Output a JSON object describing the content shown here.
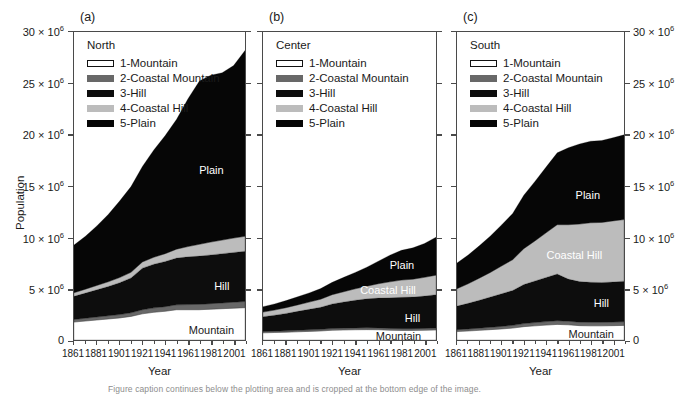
{
  "figure": {
    "ylabel": "Population",
    "xlabel": "Year",
    "caption": "Figure caption continues below the plotting area and is cropped at the bottom edge of the image."
  },
  "axes": {
    "y_ticks": [
      {
        "value": 0,
        "label": "0",
        "exp": ""
      },
      {
        "value": 5000000,
        "label": "5 × 10",
        "exp": "6"
      },
      {
        "value": 10000000,
        "label": "10 × 10",
        "exp": "6"
      },
      {
        "value": 15000000,
        "label": "15 × 10",
        "exp": "6"
      },
      {
        "value": 20000000,
        "label": "20 × 10",
        "exp": "6"
      },
      {
        "value": 25000000,
        "label": "25 × 10",
        "exp": "6"
      },
      {
        "value": 30000000,
        "label": "30 × 10",
        "exp": "6"
      }
    ],
    "x_ticks": [
      "1861",
      "1881",
      "1901",
      "1921",
      "1941",
      "1961",
      "1981",
      "2001"
    ],
    "ylim": [
      0,
      30000000
    ],
    "xlim": [
      1861,
      2011
    ]
  },
  "legend": {
    "entries": [
      {
        "key": "mountain",
        "label": "1-Mountain",
        "color": "#ffffff"
      },
      {
        "key": "cmountain",
        "label": "2-Coastal Mountain",
        "color": "#686868"
      },
      {
        "key": "hill",
        "label": "3-Hill",
        "color": "#0d0d0d"
      },
      {
        "key": "chill",
        "label": "4-Coastal Hill",
        "color": "#bcbcbc"
      },
      {
        "key": "plain",
        "label": "5-Plain",
        "color": "#060606"
      }
    ]
  },
  "panels": [
    {
      "tag": "(a)",
      "region": "North"
    },
    {
      "tag": "(b)",
      "region": "Center"
    },
    {
      "tag": "(c)",
      "region": "South"
    }
  ],
  "area_labels": {
    "a": [
      "Plain",
      "Hill",
      "Mountain"
    ],
    "b": [
      "Plain",
      "Coastal Hill",
      "Hill",
      "Mountain"
    ],
    "c": [
      "Plain",
      "Coastal Hill",
      "Hill",
      "Mountain"
    ]
  },
  "chart_data": {
    "type": "area",
    "title": "",
    "xlabel": "Year",
    "ylabel": "Population",
    "ylim": [
      0,
      30000000
    ],
    "xlim": [
      1861,
      2011
    ],
    "grid": false,
    "legend_position": "upper-left inside each panel",
    "stacked": true,
    "x": [
      1861,
      1871,
      1881,
      1891,
      1901,
      1911,
      1921,
      1931,
      1941,
      1951,
      1961,
      1971,
      1981,
      1991,
      2001,
      2011
    ],
    "panels": [
      {
        "tag": "(a)",
        "region": "North",
        "series": [
          {
            "name": "1-Mountain",
            "color": "#ffffff",
            "values": [
              1750000,
              1850000,
              1950000,
              2050000,
              2150000,
              2300000,
              2550000,
              2700000,
              2800000,
              2950000,
              2950000,
              2950000,
              3000000,
              3050000,
              3100000,
              3150000
            ]
          },
          {
            "name": "2-Coastal Mountain",
            "color": "#686868",
            "values": [
              250000,
              270000,
              290000,
              310000,
              330000,
              350000,
              400000,
              430000,
              450000,
              480000,
              500000,
              520000,
              540000,
              560000,
              580000,
              600000
            ]
          },
          {
            "name": "3-Hill",
            "color": "#0d0d0d",
            "values": [
              2250000,
              2450000,
              2650000,
              2850000,
              3100000,
              3400000,
              4050000,
              4250000,
              4400000,
              4550000,
              4650000,
              4700000,
              4750000,
              4800000,
              4850000,
              4900000
            ]
          },
          {
            "name": "4-Coastal Hill",
            "color": "#bcbcbc",
            "values": [
              350000,
              380000,
              420000,
              460000,
              500000,
              540000,
              600000,
              680000,
              760000,
              870000,
              1000000,
              1150000,
              1250000,
              1320000,
              1400000,
              1450000
            ]
          },
          {
            "name": "5-Plain",
            "color": "#060606",
            "values": [
              4650000,
              5150000,
              5800000,
              6550000,
              7450000,
              8350000,
              9300000,
              10450000,
              11500000,
              12650000,
              14400000,
              15900000,
              16250000,
              16300000,
              16800000,
              18100000
            ]
          }
        ],
        "totals": [
          9250000,
          10100000,
          11110000,
          12230000,
          13530000,
          14940000,
          16900000,
          18510000,
          19910000,
          21500000,
          23500000,
          25220000,
          25790000,
          26030000,
          26730000,
          28200000
        ]
      },
      {
        "tag": "(b)",
        "region": "Center",
        "series": [
          {
            "name": "1-Mountain",
            "color": "#ffffff",
            "values": [
              700000,
              730000,
              760000,
              800000,
              840000,
              880000,
              950000,
              980000,
              1000000,
              1010000,
              1000000,
              950000,
              930000,
              930000,
              950000,
              980000
            ]
          },
          {
            "name": "2-Coastal Mountain",
            "color": "#686868",
            "values": [
              120000,
              125000,
              130000,
              140000,
              150000,
              155000,
              165000,
              170000,
              175000,
              180000,
              180000,
              175000,
              175000,
              175000,
              180000,
              185000
            ]
          },
          {
            "name": "3-Hill",
            "color": "#0d0d0d",
            "values": [
              1450000,
              1560000,
              1700000,
              1850000,
              2000000,
              2150000,
              2400000,
              2550000,
              2700000,
              2820000,
              2900000,
              2980000,
              3050000,
              3080000,
              3150000,
              3250000
            ]
          },
          {
            "name": "4-Coastal Hill",
            "color": "#bcbcbc",
            "values": [
              450000,
              500000,
              560000,
              630000,
              700000,
              790000,
              900000,
              1000000,
              1110000,
              1230000,
              1400000,
              1560000,
              1680000,
              1740000,
              1820000,
              1900000
            ]
          },
          {
            "name": "5-Plain",
            "color": "#060606",
            "values": [
              530000,
              600000,
              690000,
              790000,
              900000,
              1030000,
              1200000,
              1400000,
              1600000,
              1850000,
              2200000,
              2600000,
              2900000,
              3050000,
              3300000,
              3700000
            ]
          }
        ],
        "totals": [
          3250000,
          3515000,
          3840000,
          4210000,
          4590000,
          5005000,
          5615000,
          6100000,
          6585000,
          7090000,
          7680000,
          8265000,
          8735000,
          8975000,
          9400000,
          10015000
        ]
      },
      {
        "tag": "(c)",
        "region": "South",
        "series": [
          {
            "name": "1-Mountain",
            "color": "#ffffff",
            "values": [
              820000,
              880000,
              940000,
              1010000,
              1080000,
              1160000,
              1300000,
              1380000,
              1450000,
              1520000,
              1480000,
              1400000,
              1380000,
              1380000,
              1400000,
              1420000
            ]
          },
          {
            "name": "2-Coastal Mountain",
            "color": "#686868",
            "values": [
              180000,
              195000,
              210000,
              225000,
              245000,
              265000,
              300000,
              320000,
              340000,
              360000,
              350000,
              340000,
              340000,
              340000,
              350000,
              360000
            ]
          },
          {
            "name": "3-Hill",
            "color": "#0d0d0d",
            "values": [
              2300000,
              2500000,
              2720000,
              2950000,
              3180000,
              3400000,
              3800000,
              4050000,
              4300000,
              4550000,
              4100000,
              3950000,
              3900000,
              3880000,
              3900000,
              3950000
            ]
          },
          {
            "name": "4-Coastal Hill",
            "color": "#bcbcbc",
            "values": [
              1700000,
              1900000,
              2150000,
              2400000,
              2700000,
              3000000,
              3500000,
              3900000,
              4350000,
              4800000,
              5300000,
              5600000,
              5800000,
              5850000,
              5950000,
              6000000
            ]
          },
          {
            "name": "5-Plain",
            "color": "#060606",
            "values": [
              2500000,
              2800000,
              3150000,
              3550000,
              4000000,
              4500000,
              5200000,
              5800000,
              6400000,
              7000000,
              7500000,
              7800000,
              7950000,
              7980000,
              8100000,
              8250000
            ]
          }
        ],
        "totals": [
          7500000,
          8275000,
          9170000,
          10135000,
          11205000,
          12325000,
          14100000,
          15450000,
          16840000,
          18230000,
          18730000,
          19090000,
          19370000,
          19430000,
          19700000,
          19980000
        ]
      }
    ]
  }
}
